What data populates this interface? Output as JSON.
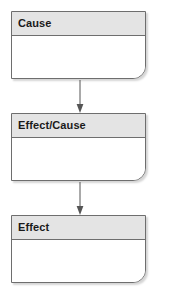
{
  "diagram": {
    "type": "flowchart",
    "background_color": "#ffffff",
    "node_fill": "#ffffff",
    "node_header_fill": "#e4e4e4",
    "node_border_color": "#6e6e6e",
    "text_color": "#1a1a1a",
    "connector_color": "#555555",
    "nodes": [
      {
        "id": "node-cause",
        "label": "Cause"
      },
      {
        "id": "node-effect-cause",
        "label": "Effect/Cause"
      },
      {
        "id": "node-effect",
        "label": "Effect"
      }
    ],
    "connectors": [
      {
        "id": "connector-1",
        "from": "Cause",
        "to": "Effect/Cause",
        "style": "arrow-down"
      },
      {
        "id": "connector-2",
        "from": "Effect/Cause",
        "to": "Effect",
        "style": "arrow-down"
      }
    ]
  }
}
